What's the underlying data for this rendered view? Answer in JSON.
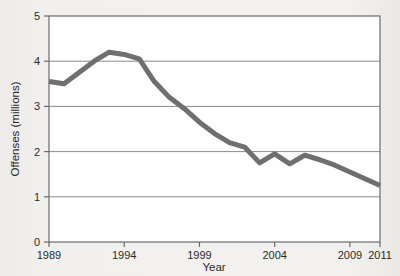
{
  "chart_data": {
    "type": "line",
    "title": "",
    "subtitle": "",
    "xlabel": "Year",
    "ylabel": "Offenses (millions)",
    "xlim": [
      1989,
      2011
    ],
    "ylim": [
      0,
      5
    ],
    "xticks": [
      1989,
      1994,
      1999,
      2004,
      2009,
      2011
    ],
    "xtick_labels": [
      "1989",
      "1994",
      "1999",
      "2004",
      "2009",
      "2011"
    ],
    "yticks": [
      0,
      1,
      2,
      3,
      4,
      5
    ],
    "ytick_labels": [
      "0",
      "1",
      "2",
      "3",
      "4",
      "5"
    ],
    "grid": "horizontal",
    "legend": "none",
    "line_color": "#6f6f6f",
    "line_width": 5,
    "plot_background": "#ffffff",
    "figure_background": "#f1f0ee",
    "axis_color": "#6b6b6b",
    "x": [
      1989,
      1990,
      1991,
      1992,
      1993,
      1994,
      1995,
      1996,
      1997,
      1998,
      1999,
      2000,
      2001,
      2002,
      2003,
      2004,
      2005,
      2006,
      2007,
      2008,
      2009,
      2010,
      2011
    ],
    "values": [
      3.55,
      3.5,
      3.75,
      4.0,
      4.2,
      4.15,
      4.05,
      3.55,
      3.2,
      2.95,
      2.65,
      2.4,
      2.2,
      2.1,
      1.75,
      1.95,
      1.73,
      1.92,
      1.82,
      1.7,
      1.55,
      1.4,
      1.25
    ],
    "series": [
      {
        "name": "Offenses",
        "values": [
          3.55,
          3.5,
          3.75,
          4.0,
          4.2,
          4.15,
          4.05,
          3.55,
          3.2,
          2.95,
          2.65,
          2.4,
          2.2,
          2.1,
          1.75,
          1.95,
          1.73,
          1.92,
          1.82,
          1.7,
          1.55,
          1.4,
          1.25
        ]
      }
    ],
    "annotations": []
  }
}
